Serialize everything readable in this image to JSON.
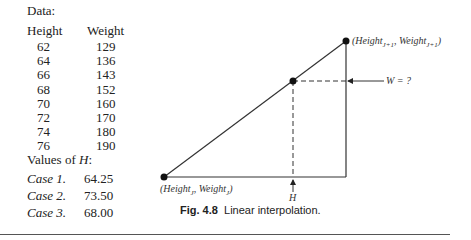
{
  "data_table": {
    "heading": "Data:",
    "columns": [
      "Height",
      "Weight"
    ],
    "rows": [
      [
        "62",
        "129"
      ],
      [
        "64",
        "136"
      ],
      [
        "66",
        "143"
      ],
      [
        "68",
        "152"
      ],
      [
        "70",
        "160"
      ],
      [
        "72",
        "170"
      ],
      [
        "74",
        "180"
      ],
      [
        "76",
        "190"
      ]
    ]
  },
  "h_values": {
    "heading": "Values of ",
    "heading_var": "H",
    "heading_suffix": ":",
    "cases": [
      {
        "label": "Case 1.",
        "value": "64.25"
      },
      {
        "label": "Case 2.",
        "value": "73.50"
      },
      {
        "label": "Case 3.",
        "value": "68.00"
      }
    ]
  },
  "diagram": {
    "point_upper_label": "(Height",
    "point_upper_sub": "J+1",
    "point_upper_label2": ", Weight",
    "point_upper_sub2": "J+1",
    "point_lower_label": "(Height",
    "point_lower_sub": "J",
    "point_lower_label2": ", Weight",
    "point_lower_sub2": "J",
    "w_label": "W = ?",
    "h_label": "H"
  },
  "caption": {
    "fig_number": "Fig. 4.8",
    "text": "Linear interpolation."
  }
}
